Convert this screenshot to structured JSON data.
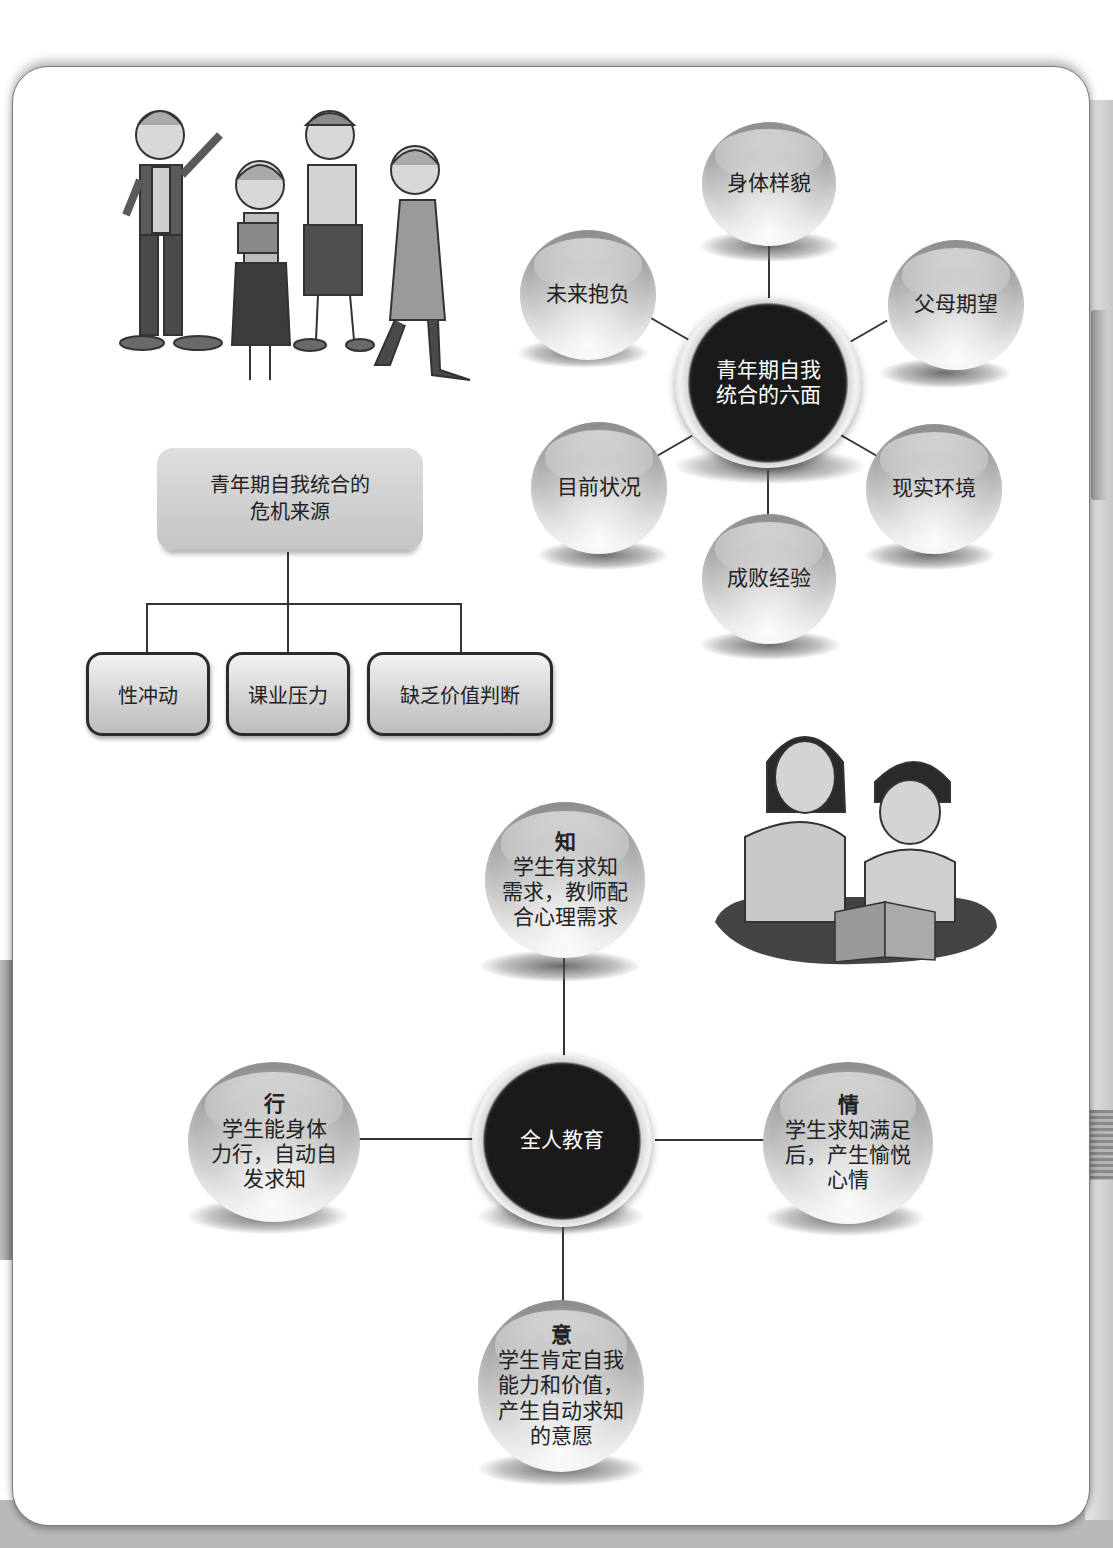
{
  "six_aspects_diagram": {
    "center": "青年期自我统合的六面",
    "center_lines": [
      "青年期自我",
      "统合的六面"
    ],
    "nodes": [
      {
        "id": "top",
        "label": "身体样貌"
      },
      {
        "id": "upper-right",
        "label": "父母期望"
      },
      {
        "id": "lower-right",
        "label": "现实环境"
      },
      {
        "id": "bottom",
        "label": "成败经验"
      },
      {
        "id": "lower-left",
        "label": "目前状况"
      },
      {
        "id": "upper-left",
        "label": "未来抱负"
      }
    ]
  },
  "crisis_tree": {
    "root_lines": [
      "青年期自我统合的",
      "危机来源"
    ],
    "children": [
      "性冲动",
      "课业压力",
      "缺乏价值判断"
    ]
  },
  "holistic_education_diagram": {
    "center": "全人教育",
    "nodes": [
      {
        "id": "top",
        "head": "知",
        "lines": [
          "学生有求知",
          "需求，教师配",
          "合心理需求"
        ]
      },
      {
        "id": "right",
        "head": "情",
        "lines": [
          "学生求知满足",
          "后，产生愉悦",
          "心情"
        ]
      },
      {
        "id": "bottom",
        "head": "意",
        "lines": [
          "学生肯定自我",
          "能力和价值，",
          "产生自动求知",
          "的意愿"
        ]
      },
      {
        "id": "left",
        "head": "行",
        "lines": [
          "学生能身体",
          "力行，自动自",
          "发求知"
        ]
      }
    ]
  },
  "illustrations": {
    "top_left": "four-teenagers-group",
    "middle_right": "teacher-and-child-reading"
  },
  "colors": {
    "panel_border": "#7a7a7a",
    "sphere_light": "#e2e2e2",
    "sphere_dark": "#1a1a1a",
    "connector": "#333333",
    "page_bg": "#b9b9b9"
  }
}
